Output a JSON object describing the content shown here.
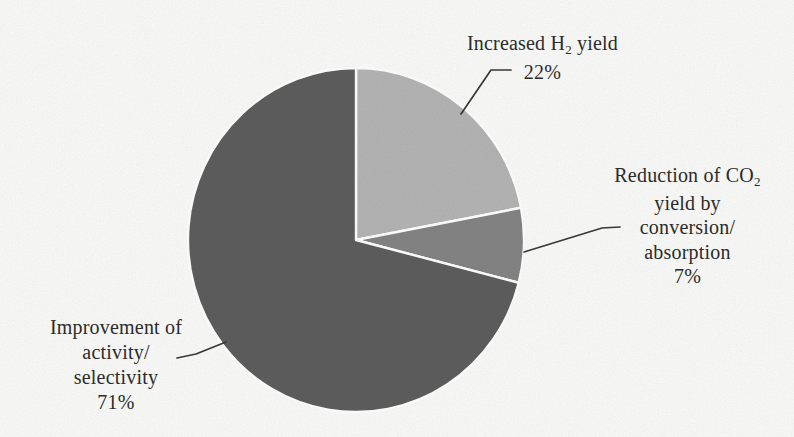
{
  "figure": {
    "background_color": "#fbfbfa",
    "text_color": "#2b2b2b",
    "leader_line_color": "#3a3a3a",
    "slice_divider_color": "#ffffff"
  },
  "chart_data": {
    "type": "pie",
    "title": "",
    "start_angle_deg": 0,
    "direction": "clockwise",
    "legend": "none",
    "labels_outside_with_leader_lines": true,
    "slices": [
      {
        "label": "Increased H2 yield",
        "value_pct": 22,
        "color": "#b5b5b5"
      },
      {
        "label": "Reduction of CO2 yield by conversion/absorption",
        "value_pct": 7,
        "color": "#858585"
      },
      {
        "label": "Improvement of activity/selectivity",
        "value_pct": 71,
        "color": "#5e5e5e"
      }
    ]
  },
  "labels": {
    "increased_h2": {
      "pre": "Increased H",
      "sub": "2",
      "post": " yield",
      "pct": "22%"
    },
    "reduction_co2": {
      "pre": "Reduction of CO",
      "sub": "2",
      "line2": "yield by",
      "line3": "conversion/",
      "line4": "absorption",
      "pct": "7%"
    },
    "improvement": {
      "line1": "Improvement of",
      "line2": "activity/",
      "line3": "selectivity",
      "pct": "71%"
    }
  },
  "leader_lines": {
    "increased_h2": [
      [
        511,
        70
      ],
      [
        491,
        70
      ],
      [
        461,
        114
      ]
    ],
    "reduction_co2": [
      [
        620,
        227
      ],
      [
        602,
        228
      ],
      [
        524,
        252
      ]
    ],
    "improvement": [
      [
        177,
        358
      ],
      [
        196,
        354
      ],
      [
        226,
        342
      ]
    ]
  }
}
